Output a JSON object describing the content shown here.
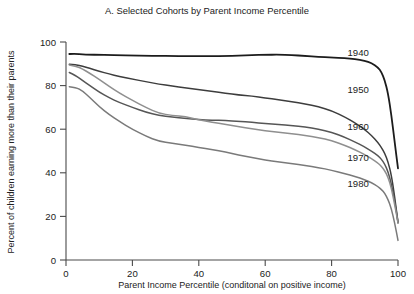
{
  "chart_data": {
    "type": "line",
    "title": "A. Selected Cohorts by Parent Income Percentile",
    "xlabel": "Parent Income Percentile (conditonal on positive income)",
    "ylabel": "Percent of children earning more than their parents",
    "xlim": [
      0,
      100
    ],
    "ylim": [
      0,
      100
    ],
    "xticks": [
      0,
      20,
      40,
      60,
      80,
      100
    ],
    "yticks": [
      0,
      20,
      40,
      60,
      80,
      100
    ],
    "xtick_labels": [
      "0",
      "20",
      "40",
      "60",
      "80",
      "100"
    ],
    "ytick_labels": [
      "0",
      "20",
      "40",
      "60",
      "80",
      "100"
    ],
    "grid": false,
    "legend_position": "inline-right-of-curves",
    "x": [
      1,
      3,
      5,
      7,
      10,
      13,
      16,
      20,
      24,
      28,
      32,
      36,
      40,
      44,
      48,
      52,
      56,
      60,
      64,
      68,
      72,
      76,
      80,
      84,
      87,
      90,
      92,
      94,
      95,
      96,
      97,
      98,
      99,
      100
    ],
    "series": [
      {
        "name": "1940",
        "label": "1940",
        "color": "#1c1c1c",
        "linewidth": 1.8,
        "label_x": 88,
        "label_y": 95,
        "values": [
          94.5,
          94.6,
          94.3,
          94.2,
          94.1,
          94.0,
          93.9,
          93.8,
          93.7,
          93.6,
          93.6,
          93.5,
          93.5,
          93.5,
          93.6,
          93.7,
          94.0,
          94.1,
          94.2,
          94.0,
          93.6,
          93.2,
          92.9,
          92.6,
          92.2,
          91.4,
          90.4,
          88.3,
          86.2,
          82.5,
          76.5,
          66.5,
          54.0,
          42.0
        ]
      },
      {
        "name": "1950",
        "label": "1950",
        "color": "#3d3d3d",
        "linewidth": 1.5,
        "label_x": 88,
        "label_y": 78,
        "values": [
          89.8,
          89.6,
          88.9,
          88.0,
          86.6,
          85.3,
          84.2,
          83.0,
          81.8,
          80.7,
          79.8,
          79.0,
          78.2,
          77.4,
          76.6,
          75.7,
          75.2,
          74.4,
          73.5,
          72.6,
          71.6,
          70.3,
          68.5,
          65.6,
          63.0,
          59.8,
          57.2,
          53.8,
          51.6,
          49.0,
          45.0,
          39.0,
          29.0,
          17.0
        ]
      },
      {
        "name": "1960",
        "label": "1960",
        "color": "#565656",
        "linewidth": 1.5,
        "label_x": 88,
        "label_y": 61,
        "values": [
          86.0,
          84.5,
          82.3,
          80.2,
          77.0,
          74.4,
          72.3,
          70.0,
          67.8,
          66.3,
          65.6,
          65.0,
          64.4,
          64.1,
          64.0,
          63.6,
          63.2,
          62.6,
          62.2,
          61.6,
          61.0,
          60.0,
          58.6,
          56.3,
          54.2,
          51.8,
          50.0,
          47.8,
          46.3,
          44.0,
          40.5,
          35.0,
          27.0,
          17.5
        ]
      },
      {
        "name": "1970",
        "label": "1970",
        "color": "#8f8f8f",
        "linewidth": 1.5,
        "label_x": 88,
        "label_y": 47,
        "values": [
          89.5,
          89.0,
          87.6,
          85.8,
          82.8,
          79.6,
          76.6,
          73.2,
          70.0,
          67.3,
          66.3,
          65.7,
          64.4,
          63.2,
          62.2,
          61.2,
          60.2,
          59.2,
          58.6,
          58.0,
          57.2,
          56.2,
          54.8,
          52.6,
          50.6,
          48.3,
          46.5,
          44.4,
          43.0,
          41.0,
          38.0,
          33.0,
          25.5,
          17.0
        ]
      },
      {
        "name": "1980",
        "label": "1980",
        "color": "#7a7a7a",
        "linewidth": 1.5,
        "label_x": 88,
        "label_y": 35,
        "values": [
          79.5,
          79.2,
          77.5,
          74.8,
          70.3,
          66.7,
          63.6,
          60.0,
          56.8,
          54.5,
          53.5,
          52.7,
          51.6,
          50.6,
          49.6,
          48.2,
          47.0,
          45.8,
          45.0,
          44.2,
          43.4,
          42.4,
          41.2,
          39.6,
          38.4,
          36.8,
          35.5,
          33.6,
          32.4,
          30.6,
          27.8,
          23.5,
          17.0,
          9.0
        ]
      }
    ]
  }
}
